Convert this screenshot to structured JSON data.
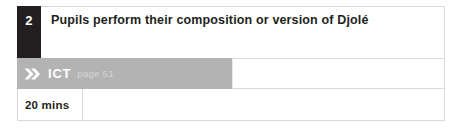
{
  "activity": {
    "step_number": "2",
    "title": "Pupils perform their composition or version of Djolé",
    "resource_row": {
      "icon": "double-chevron-icon",
      "label": "ICT",
      "page_reference": "page 51"
    },
    "duration_row": {
      "duration": "20 mins"
    }
  },
  "colors": {
    "step_number_background": "#231f20",
    "resource_band_background": "#b3b3b3",
    "border": "#d9d9d9",
    "text": "#231f20",
    "page_reference_text": "#d6d6d6"
  }
}
